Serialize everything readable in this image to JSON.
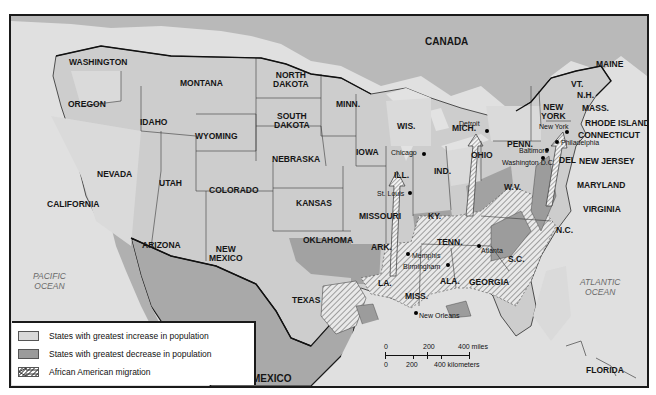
{
  "map": {
    "title": "African American Migration and U.S. Population Change",
    "colors": {
      "land": "#c9c9c9",
      "ocean": "#e2e2e2",
      "canada": "#b5b5b5",
      "mexico": "#a8a8a8",
      "increase": "#dadada",
      "decrease": "#9c9c9c",
      "migration_hatch": "#8a8a8a",
      "border": "#1a1a1a"
    },
    "countries": [
      "CANADA",
      "MEXICO"
    ],
    "oceans": {
      "pacific": [
        "PACIFIC",
        "OCEAN"
      ],
      "atlantic": [
        "ATLANTIC",
        "OCEAN"
      ]
    },
    "states": {
      "washington": "WASHINGTON",
      "oregon": "OREGON",
      "california": "CALIFORNIA",
      "idaho": "IDAHO",
      "nevada": "NEVADA",
      "montana": "MONTANA",
      "wyoming": "WYOMING",
      "utah": "UTAH",
      "colorado": "COLORADO",
      "arizona": "ARIZONA",
      "new_mexico": [
        "NEW",
        "MEXICO"
      ],
      "north_dakota": [
        "NORTH",
        "DAKOTA"
      ],
      "south_dakota": [
        "SOUTH",
        "DAKOTA"
      ],
      "nebraska": "NEBRASKA",
      "kansas": "KANSAS",
      "oklahoma": "OKLAHOMA",
      "texas": "TEXAS",
      "minnesota": "MINN.",
      "iowa": "IOWA",
      "missouri": "MISSOURI",
      "arkansas": "ARK.",
      "louisiana": "LA.",
      "wisconsin": "WIS.",
      "illinois": "ILL.",
      "michigan": "MICH.",
      "indiana": "IND.",
      "ohio": "OHIO",
      "kentucky": "KY.",
      "tennessee": "TENN.",
      "mississippi": "MISS.",
      "alabama": "ALA.",
      "georgia": "GEORGIA",
      "florida": "FLORIDA",
      "south_carolina": "S.C.",
      "north_carolina": "N.C.",
      "virginia": "VIRGINIA",
      "west_virginia": "W.V.",
      "maryland": "MARYLAND",
      "delaware": "DEL",
      "new_jersey": "NEW JERSEY",
      "pennsylvania": "PENN.",
      "new_york": [
        "NEW",
        "YORK"
      ],
      "connecticut": "CONNECTICUT",
      "rhode_island": "RHODE ISLAND",
      "massachusetts": "MASS.",
      "vermont": "VT.",
      "new_hampshire": "N.H.",
      "maine": "MAINE"
    },
    "cities": {
      "detroit": "Detroit",
      "chicago": "Chicago",
      "st_louis": "St. Louis",
      "new_york": "New York",
      "philadelphia": "Philadelphia",
      "baltimore": "Baltimore",
      "washington_dc": "Washington D.C.",
      "memphis": "Memphis",
      "birmingham": "Birmingham",
      "atlanta": "Atlanta",
      "new_orleans": "New Orleans"
    }
  },
  "legend": {
    "items": [
      {
        "label": "States with greatest increase in population",
        "swatch": "increase"
      },
      {
        "label": "States with greatest decrease in population",
        "swatch": "decrease"
      },
      {
        "label": "African American migration",
        "swatch": "migration-arrow"
      }
    ]
  },
  "scale_bar": {
    "miles_ticks": [
      "0",
      "200",
      "400 miles"
    ],
    "km_ticks": [
      "0",
      "200",
      "400 kilometers"
    ]
  }
}
